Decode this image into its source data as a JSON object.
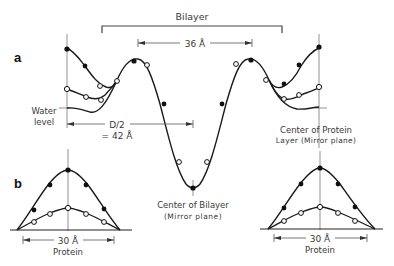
{
  "figure": {
    "panel_a": {
      "label": "a",
      "bilayer_label": "Bilayer",
      "distance_36": "36 Å",
      "water_level_line1": "Water",
      "water_level_line2": "level",
      "half_period_line1": "D/2",
      "half_period_line2": "= 42 Å",
      "center_bilayer_line1": "Center of Bilayer",
      "center_bilayer_line2": "(Mirror plane)",
      "center_protein_line1": "Center of Protein",
      "center_protein_line2": "Layer (Mirror plane)"
    },
    "panel_b": {
      "label": "b",
      "left_width": "30 Å",
      "left_caption": "Protein",
      "right_width": "30 Å",
      "right_caption": "Protein"
    },
    "legend_markers": {
      "filled_circle": "filled-data-point",
      "open_circle": "open-data-point"
    },
    "colors": {
      "line": "#1a1a1a",
      "axis": "#555555",
      "text": "#3a3a3a"
    }
  }
}
